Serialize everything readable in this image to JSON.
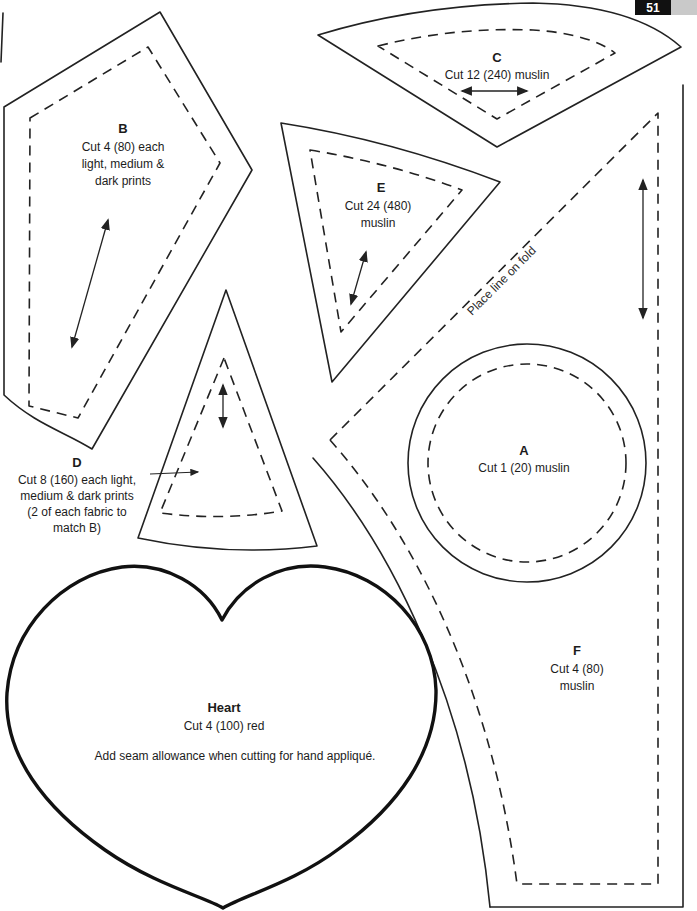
{
  "page": {
    "number": "51"
  },
  "colors": {
    "ink": "#1c1c1c",
    "page_bg": "#ffffff",
    "badge_bg": "#111111",
    "badge_text": "#ffffff",
    "corner_strip": "#c9c9c9"
  },
  "templates": {
    "b": {
      "letter": "B",
      "lines": [
        "Cut 4 (80) each",
        "light, medium &",
        "dark prints"
      ]
    },
    "c": {
      "letter": "C",
      "lines": [
        "Cut 12 (240) muslin"
      ]
    },
    "e": {
      "letter": "E",
      "lines": [
        "Cut 24 (480)",
        "muslin"
      ]
    },
    "d": {
      "letter": "D",
      "lines": [
        "Cut 8 (160) each light,",
        "medium & dark prints",
        "(2 of each fabric to",
        "match B)"
      ]
    },
    "a": {
      "letter": "A",
      "lines": [
        "Cut 1 (20) muslin"
      ]
    },
    "f": {
      "letter": "F",
      "lines": [
        "Cut 4 (80)",
        "muslin"
      ]
    },
    "heart": {
      "name": "Heart",
      "lines": [
        "Cut 4 (100) red"
      ],
      "note": "Add seam allowance when cutting for hand appliqué."
    }
  },
  "fold_note": "Place line on fold"
}
